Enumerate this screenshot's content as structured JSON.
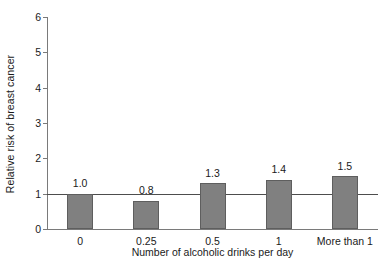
{
  "chart_data": {
    "type": "bar",
    "title": "",
    "xlabel": "Number of alcoholic drinks per day",
    "ylabel": "Relative risk of breast cancer",
    "categories": [
      "0",
      "0.25",
      "0.5",
      "1",
      "More than 1"
    ],
    "values": [
      1.0,
      0.8,
      1.3,
      1.4,
      1.5
    ],
    "value_labels": [
      "1.0",
      "0.8",
      "1.3",
      "1.4",
      "1.5"
    ],
    "ylim": [
      0,
      6
    ],
    "ytick_labels": [
      "0",
      "1",
      "2",
      "3",
      "4",
      "5",
      "6"
    ],
    "ytick_values": [
      0,
      1,
      2,
      3,
      4,
      5,
      6
    ],
    "grid": false,
    "legend": "none",
    "reference_line": {
      "value": 1,
      "label": ""
    },
    "colors": {
      "bar_fill": "#808080",
      "bar_edge": "#5e5e5e",
      "axis": "#7a7a7a",
      "reference_line": "#4d4d4d",
      "text": "#1a1a1a",
      "background": "#ffffff"
    }
  }
}
